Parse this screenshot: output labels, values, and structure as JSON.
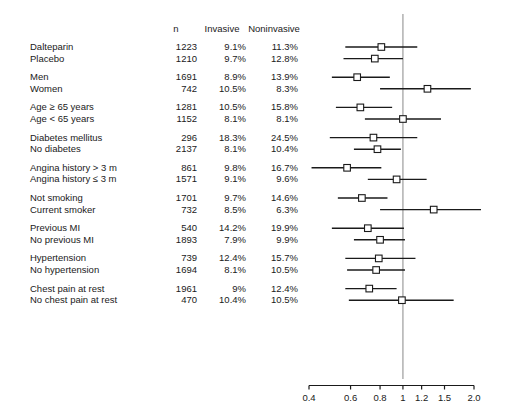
{
  "header": {
    "label": "",
    "n": "n",
    "invasive": "Invasive",
    "noninvasive": "Noninvasive"
  },
  "axis": {
    "ticks": [
      "0.4",
      "0.6",
      "0.8",
      "1",
      "1.2",
      "1.5",
      "2.0"
    ],
    "tick_values": [
      0.4,
      0.6,
      0.8,
      1.0,
      1.2,
      1.5,
      2.0
    ],
    "scale": "log",
    "reference_line": 1.0,
    "xmin": 0.38,
    "xmax": 2.08
  },
  "colors": {
    "line": "#1a1a1a",
    "marker_fill": "#ffffff",
    "marker_stroke": "#1a1a1a",
    "reference_line": "#888888",
    "text": "#1a1a1a",
    "background": "#ffffff"
  },
  "chart_data": {
    "type": "forest",
    "title": "",
    "xlabel": "",
    "ylabel": "",
    "xscale": "log",
    "xlim": [
      0.38,
      2.08
    ],
    "reference_line": 1.0,
    "columns": [
      "",
      "n",
      "Invasive",
      "Noninvasive"
    ],
    "rows": [
      {
        "label": "Dalteparin",
        "n": "1223",
        "invasive": "9.1%",
        "noninvasive": "11.3%",
        "group": 0,
        "rr": 0.81,
        "lo": 0.57,
        "hi": 1.15
      },
      {
        "label": "Placebo",
        "n": "1210",
        "invasive": "9.7%",
        "noninvasive": "12.8%",
        "group": 0,
        "rr": 0.76,
        "lo": 0.56,
        "hi": 1.0
      },
      {
        "label": "Men",
        "n": "1691",
        "invasive": "8.9%",
        "noninvasive": "13.9%",
        "group": 1,
        "rr": 0.64,
        "lo": 0.5,
        "hi": 0.88
      },
      {
        "label": "Women",
        "n": "742",
        "invasive": "10.5%",
        "noninvasive": "8.3%",
        "group": 1,
        "rr": 1.27,
        "lo": 0.8,
        "hi": 1.94
      },
      {
        "label": "Age ≥ 65 years",
        "n": "1281",
        "invasive": "10.5%",
        "noninvasive": "15.8%",
        "group": 2,
        "rr": 0.66,
        "lo": 0.52,
        "hi": 0.9
      },
      {
        "label": "Age < 65 years",
        "n": "1152",
        "invasive": "8.1%",
        "noninvasive": "8.1%",
        "group": 2,
        "rr": 1.0,
        "lo": 0.69,
        "hi": 1.45
      },
      {
        "label": "Diabetes mellitus",
        "n": "296",
        "invasive": "18.3%",
        "noninvasive": "24.5%",
        "group": 3,
        "rr": 0.75,
        "lo": 0.49,
        "hi": 1.15
      },
      {
        "label": "No diabetes",
        "n": "2137",
        "invasive": "8.1%",
        "noninvasive": "10.4%",
        "group": 3,
        "rr": 0.78,
        "lo": 0.62,
        "hi": 0.98
      },
      {
        "label": "Angina history > 3 m",
        "n": "861",
        "invasive": "9.8%",
        "noninvasive": "16.7%",
        "group": 4,
        "rr": 0.58,
        "lo": 0.41,
        "hi": 0.81
      },
      {
        "label": "Angina history ≤ 3 m",
        "n": "1571",
        "invasive": "9.1%",
        "noninvasive": "9.6%",
        "group": 4,
        "rr": 0.94,
        "lo": 0.71,
        "hi": 1.26
      },
      {
        "label": "Not smoking",
        "n": "1701",
        "invasive": "9.7%",
        "noninvasive": "14.6%",
        "group": 5,
        "rr": 0.67,
        "lo": 0.53,
        "hi": 0.86
      },
      {
        "label": "Current smoker",
        "n": "732",
        "invasive": "8.5%",
        "noninvasive": "6.3%",
        "group": 5,
        "rr": 1.35,
        "lo": 0.8,
        "hi": 2.2
      },
      {
        "label": "Previous MI",
        "n": "540",
        "invasive": "14.2%",
        "noninvasive": "19.9%",
        "group": 6,
        "rr": 0.71,
        "lo": 0.5,
        "hi": 1.01
      },
      {
        "label": "No previous MI",
        "n": "1893",
        "invasive": "7.9%",
        "noninvasive": "9.9%",
        "group": 6,
        "rr": 0.8,
        "lo": 0.62,
        "hi": 1.02
      },
      {
        "label": "Hypertension",
        "n": "739",
        "invasive": "12.4%",
        "noninvasive": "15.7%",
        "group": 7,
        "rr": 0.79,
        "lo": 0.57,
        "hi": 1.13
      },
      {
        "label": "No hypertension",
        "n": "1694",
        "invasive": "8.1%",
        "noninvasive": "10.5%",
        "group": 7,
        "rr": 0.77,
        "lo": 0.58,
        "hi": 1.02
      },
      {
        "label": "Chest pain at rest",
        "n": "1961",
        "invasive": "9%",
        "noninvasive": "12.4%",
        "group": 8,
        "rr": 0.72,
        "lo": 0.57,
        "hi": 0.94
      },
      {
        "label": "No chest pain at rest",
        "n": "470",
        "invasive": "10.4%",
        "noninvasive": "10.5%",
        "group": 8,
        "rr": 0.99,
        "lo": 0.59,
        "hi": 1.64
      }
    ]
  }
}
